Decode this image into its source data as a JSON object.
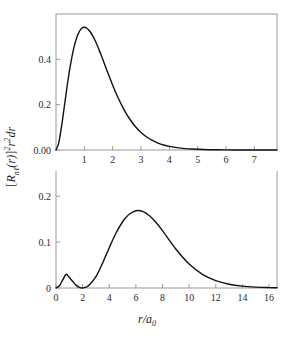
{
  "figure": {
    "background": "#ffffff",
    "curve_color": "#111111",
    "axis_color": "#9a9a9a",
    "ylabel_parts": {
      "open_bracket": "[",
      "R": "R",
      "sub_nl": "nℓ",
      "of_r": "(r)",
      "close_bracket": "]",
      "sup_2": "2",
      "r2": "r",
      "sup_2b": "2",
      "dr": "dr"
    },
    "ylabel_text": "[Rₙℓ(r)]²r²dr",
    "xlabel_main": "r/a",
    "xlabel_sub": "0",
    "xlabel_text": "r/a₀"
  },
  "chart_data": [
    {
      "id": "panel-top",
      "type": "line",
      "title": "",
      "subtitle": "",
      "xlabel": "",
      "ylabel": "[R_nl(r)]^2 r^2 dr",
      "orbital": "1s",
      "n": 1,
      "l": 0,
      "xlim": [
        0,
        7.8
      ],
      "ylim": [
        0,
        0.6
      ],
      "xticks": [
        1,
        2,
        3,
        4,
        5,
        6,
        7
      ],
      "xticklabels": [
        "1",
        "2",
        "3",
        "4",
        "5",
        "6",
        "7"
      ],
      "yticks": [
        0.0,
        0.2,
        0.4
      ],
      "yticklabels": [
        "0.00",
        "0.2",
        "0.4"
      ],
      "grid": false,
      "legend": "none",
      "frame": "box",
      "peak_x": 1.0,
      "peak_y": 0.541,
      "formula": "4*r^2*exp(-2*r)",
      "x": [
        0.0,
        0.1,
        0.2,
        0.3,
        0.4,
        0.5,
        0.6,
        0.7,
        0.8,
        0.9,
        1.0,
        1.1,
        1.2,
        1.3,
        1.4,
        1.5,
        1.6,
        1.8,
        2.0,
        2.2,
        2.4,
        2.6,
        2.8,
        3.0,
        3.2,
        3.4,
        3.6,
        3.8,
        4.0,
        4.4,
        4.8,
        5.2,
        5.6,
        6.0,
        6.5,
        7.0,
        7.5,
        7.8
      ],
      "values": [
        0.0,
        0.0328,
        0.1073,
        0.1975,
        0.2879,
        0.3679,
        0.4337,
        0.4837,
        0.5176,
        0.5358,
        0.5413,
        0.5362,
        0.5227,
        0.5026,
        0.4775,
        0.4481,
        0.417,
        0.3501,
        0.2861,
        0.2284,
        0.1784,
        0.1368,
        0.1034,
        0.0773,
        0.0573,
        0.042,
        0.0305,
        0.022,
        0.0161,
        0.0083,
        0.0042,
        0.0021,
        0.001,
        0.0005,
        0.0002,
        0.0001,
        0.0,
        0.0
      ]
    },
    {
      "id": "panel-bottom",
      "type": "line",
      "title": "",
      "subtitle": "",
      "xlabel": "r/a_0",
      "ylabel": "[R_nl(r)]^2 r^2 dr",
      "orbital": "2s",
      "n": 2,
      "l": 0,
      "xlim": [
        0,
        16.6
      ],
      "ylim": [
        0,
        0.255
      ],
      "xticks": [
        0,
        2,
        4,
        6,
        8,
        10,
        12,
        14,
        16
      ],
      "xticklabels": [
        "0",
        "2",
        "4",
        "6",
        "8",
        "10",
        "12",
        "14",
        "16"
      ],
      "yticks": [
        0.0,
        0.1,
        0.2
      ],
      "yticklabels": [
        "0",
        "0.1",
        "0.2"
      ],
      "grid": false,
      "legend": "none",
      "frame": "box",
      "first_peak_x": 0.76,
      "first_peak_y": 0.06,
      "node_x": 2.0,
      "node_y": 0.0,
      "main_peak_x": 5.24,
      "main_peak_y": 0.222,
      "formula": "0.125*r^2*(2-r)^2*exp(-r)",
      "x": [
        0.0,
        0.25,
        0.5,
        0.76,
        1.0,
        1.25,
        1.5,
        1.75,
        2.0,
        2.25,
        2.5,
        3.0,
        3.5,
        4.0,
        4.5,
        5.0,
        5.24,
        5.5,
        6.0,
        6.5,
        7.0,
        7.5,
        8.0,
        9.0,
        10.0,
        11.0,
        12.0,
        13.0,
        14.0,
        15.0,
        16.0,
        16.6
      ],
      "values": [
        0.0,
        0.0048,
        0.0171,
        0.03,
        0.023,
        0.0146,
        0.0063,
        0.0013,
        0.0,
        0.0017,
        0.0064,
        0.0249,
        0.0543,
        0.0879,
        0.1194,
        0.1444,
        0.1531,
        0.1607,
        0.1683,
        0.167,
        0.158,
        0.1433,
        0.125,
        0.085,
        0.0522,
        0.0298,
        0.0161,
        0.0083,
        0.0041,
        0.002,
        0.0009,
        0.0006
      ]
    }
  ]
}
